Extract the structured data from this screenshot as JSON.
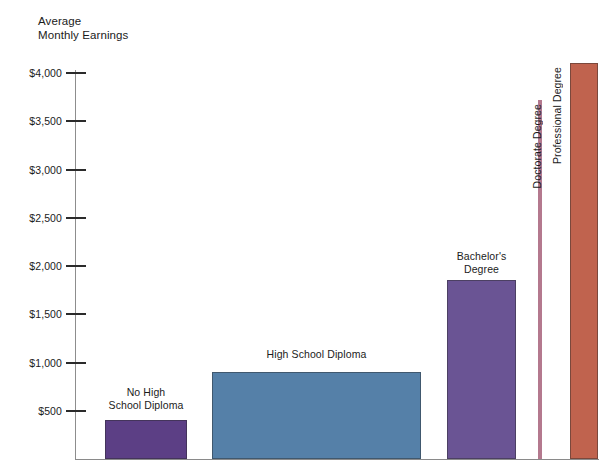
{
  "chart_data": {
    "type": "bar",
    "title": "Average Monthly Earnings",
    "title_line1": "Average",
    "title_line2": "Monthly Earnings",
    "xlabel": "",
    "ylabel": "Average Monthly Earnings",
    "ylim": [
      0,
      4200
    ],
    "grid": false,
    "legend": "none",
    "ytick_labels": [
      "$4,000",
      "$3,500",
      "$3,000",
      "$2,500",
      "$2,000",
      "$1,500",
      "$1,000",
      "$500"
    ],
    "ytick_values": [
      4000,
      3500,
      3000,
      2500,
      2000,
      1500,
      1000,
      500
    ],
    "categories": [
      "No High School Diploma",
      "High School Diploma",
      "Bachelor's Degree",
      "Doctorate Degree",
      "Professional Degree"
    ],
    "values": [
      400,
      900,
      1850,
      3720,
      4100
    ],
    "colors": [
      "#5c3f85",
      "#5580a8",
      "#6a5494",
      "#b4798e",
      "#c0634e"
    ],
    "bars": [
      {
        "label": "No High School Diploma",
        "label_line1": "No High",
        "label_line2": "School Diploma",
        "value": 400,
        "color": "#5c3f85",
        "label_orientation": "horizontal"
      },
      {
        "label": "High School Diploma",
        "label_line1": "High School Diploma",
        "label_line2": "",
        "value": 900,
        "color": "#5580a8",
        "label_orientation": "horizontal"
      },
      {
        "label": "Bachelor's Degree",
        "label_line1": "Bachelor's",
        "label_line2": "Degree",
        "value": 1850,
        "color": "#6a5494",
        "label_orientation": "horizontal"
      },
      {
        "label": "Doctorate Degree",
        "label_line1": "Doctorate Degree",
        "label_line2": "",
        "value": 3720,
        "color": "#b4798e",
        "label_orientation": "vertical"
      },
      {
        "label": "Professional Degree",
        "label_line1": "Professional Degree",
        "label_line2": "",
        "value": 4100,
        "color": "#c0634e",
        "label_orientation": "vertical"
      }
    ],
    "colors_named": {
      "background": "#ffffff",
      "axis": "#8a8a8a",
      "tick": "#2b2b2b",
      "text": "#1b1b1b"
    }
  }
}
